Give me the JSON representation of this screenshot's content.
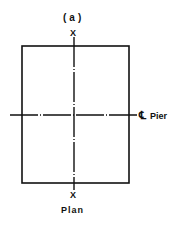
{
  "diagram": {
    "panel_label": "(a)",
    "section_markers": {
      "top": "X",
      "bottom": "X"
    },
    "centerline_symbol": "℄",
    "centerline_label": "Pier",
    "view_label": "Plan",
    "line_color": "#111111",
    "background": "#ffffff"
  }
}
